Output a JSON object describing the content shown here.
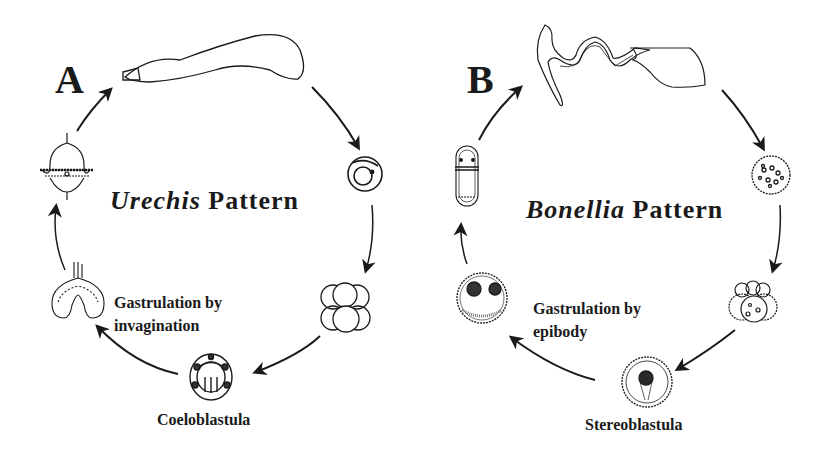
{
  "panels": [
    {
      "letter": "A",
      "title_italic": "Urechis",
      "title_rest": " Pattern",
      "gastrulation_line1": "Gastrulation by",
      "gastrulation_line2": "invagination",
      "blastula_label": "Coeloblastula",
      "stages": [
        "adult-worm",
        "egg",
        "cleavage-embryo",
        "coeloblastula",
        "gastrula-invagination",
        "trochophore-larva"
      ]
    },
    {
      "letter": "B",
      "title_italic": "Bonellia",
      "title_rest": " Pattern",
      "gastrulation_line1": "Gastrulation by",
      "gastrulation_line2": "epibody",
      "blastula_label": "Stereoblastula",
      "stages": [
        "adult-worm",
        "egg",
        "cleavage-embryo",
        "stereoblastula",
        "gastrula-epiboly",
        "larva"
      ]
    }
  ]
}
